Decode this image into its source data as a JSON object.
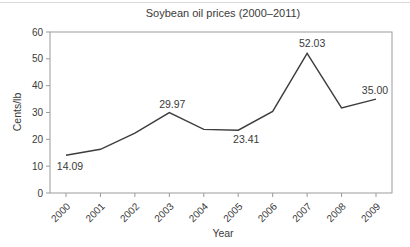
{
  "chart_data": {
    "type": "line",
    "title": "Soybean oil prices (2000–2011)",
    "xlabel": "Year",
    "ylabel": "Cents/lb",
    "categories": [
      "2000",
      "2001",
      "2002",
      "2003",
      "2004",
      "2005",
      "2006",
      "2007",
      "2008",
      "2009"
    ],
    "values": [
      14.09,
      16.3,
      22.3,
      29.97,
      23.7,
      23.41,
      30.4,
      52.03,
      31.7,
      35.0
    ],
    "ylim": [
      0,
      60
    ],
    "yticks": [
      "0",
      "10",
      "20",
      "30",
      "40",
      "50",
      "60"
    ],
    "grid": false,
    "legend": "none",
    "point_labels": [
      {
        "index": 0,
        "text": "14.09",
        "dx": 4,
        "dy": 15,
        "anchor": "middle"
      },
      {
        "index": 3,
        "text": "29.97",
        "dx": 3,
        "dy": -5,
        "anchor": "middle"
      },
      {
        "index": 5,
        "text": "23.41",
        "dx": 8,
        "dy": 13,
        "anchor": "middle"
      },
      {
        "index": 7,
        "text": "52.03",
        "dx": 5,
        "dy": -6,
        "anchor": "middle"
      },
      {
        "index": 9,
        "text": "35.00",
        "dx": -1,
        "dy": -5,
        "anchor": "middle"
      }
    ],
    "colors": {
      "line": "#3d3d3d",
      "axis": "#9b9b9b",
      "text": "#3a3a3a"
    }
  }
}
